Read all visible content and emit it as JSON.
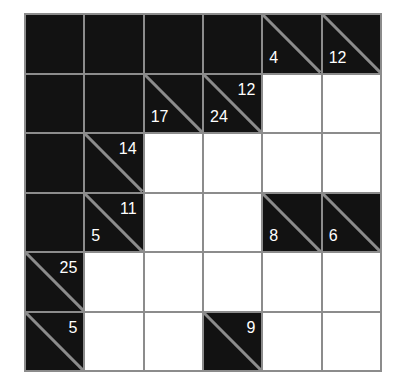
{
  "puzzle": {
    "type": "kakuro",
    "rows": 6,
    "cols": 6,
    "colors": {
      "grid_line": "#8c8c8c",
      "block": "#121212",
      "empty_cell": "#ffffff",
      "clue_text": "#ffffff"
    },
    "grid": [
      [
        {
          "kind": "block"
        },
        {
          "kind": "block"
        },
        {
          "kind": "block"
        },
        {
          "kind": "block"
        },
        {
          "kind": "clue",
          "down": "4",
          "right": ""
        },
        {
          "kind": "clue",
          "down": "12",
          "right": ""
        }
      ],
      [
        {
          "kind": "block"
        },
        {
          "kind": "block"
        },
        {
          "kind": "clue",
          "down": "17",
          "right": ""
        },
        {
          "kind": "clue",
          "down": "24",
          "right": "12"
        },
        {
          "kind": "white",
          "value": ""
        },
        {
          "kind": "white",
          "value": ""
        }
      ],
      [
        {
          "kind": "block"
        },
        {
          "kind": "clue",
          "down": "",
          "right": "14"
        },
        {
          "kind": "white",
          "value": ""
        },
        {
          "kind": "white",
          "value": ""
        },
        {
          "kind": "white",
          "value": ""
        },
        {
          "kind": "white",
          "value": ""
        }
      ],
      [
        {
          "kind": "block"
        },
        {
          "kind": "clue",
          "down": "5",
          "right": "11"
        },
        {
          "kind": "white",
          "value": ""
        },
        {
          "kind": "white",
          "value": ""
        },
        {
          "kind": "clue",
          "down": "8",
          "right": ""
        },
        {
          "kind": "clue",
          "down": "6",
          "right": ""
        }
      ],
      [
        {
          "kind": "clue",
          "down": "",
          "right": "25"
        },
        {
          "kind": "white",
          "value": ""
        },
        {
          "kind": "white",
          "value": ""
        },
        {
          "kind": "white",
          "value": ""
        },
        {
          "kind": "white",
          "value": ""
        },
        {
          "kind": "white",
          "value": ""
        }
      ],
      [
        {
          "kind": "clue",
          "down": "",
          "right": "5"
        },
        {
          "kind": "white",
          "value": ""
        },
        {
          "kind": "white",
          "value": ""
        },
        {
          "kind": "clue",
          "down": "",
          "right": "9"
        },
        {
          "kind": "white",
          "value": ""
        },
        {
          "kind": "white",
          "value": ""
        }
      ]
    ]
  }
}
